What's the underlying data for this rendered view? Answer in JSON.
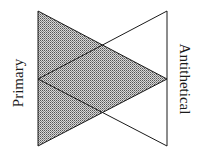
{
  "diagram": {
    "left_label": "Primary",
    "right_label": "Antithetical",
    "colors": {
      "stroke": "#1a1a1a",
      "shade_dot": "#555555",
      "background": "#ffffff"
    },
    "shapes": [
      {
        "name": "primary-triangle",
        "shaded": true,
        "points": [
          [
            38,
            11
          ],
          [
            38,
            146
          ],
          [
            167,
            79
          ]
        ]
      },
      {
        "name": "antithetical-triangle",
        "shaded": false,
        "points": [
          [
            167,
            11
          ],
          [
            167,
            146
          ],
          [
            38,
            79
          ]
        ]
      }
    ]
  }
}
